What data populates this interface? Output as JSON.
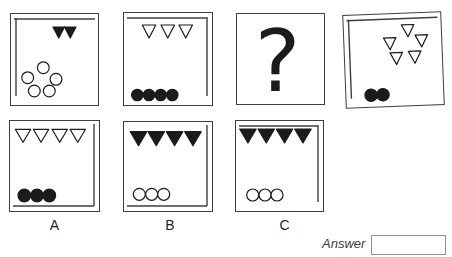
{
  "figure": {
    "cells": [
      {
        "name": "cell-1",
        "inner_line": "top-left",
        "triangles": {
          "style": "filled",
          "count": 2,
          "size": [
            11.5,
            11
          ],
          "positions": [
            [
              42,
              13
            ],
            [
              53.5,
              13
            ]
          ]
        },
        "circles": {
          "style": "outline",
          "count": 5,
          "radius": 5.9,
          "positions": [
            [
              32.3,
              53.7
            ],
            [
              16.7,
              63.7
            ],
            [
              45,
              65.3
            ],
            [
              23.3,
              77
            ],
            [
              38.3,
              77
            ]
          ]
        }
      },
      {
        "name": "cell-2",
        "inner_line": "top-right",
        "triangles": {
          "style": "outline",
          "count": 3,
          "size": [
            13.5,
            13
          ],
          "positions": [
            [
              18.3,
              12
            ],
            [
              37,
              12
            ],
            [
              55,
              12
            ]
          ]
        },
        "circles": {
          "style": "filled",
          "count": 4,
          "radius": 5.7,
          "positions": [
            [
              13.3,
              82
            ],
            [
              25,
              82
            ],
            [
              36.7,
              82
            ],
            [
              48.3,
              82
            ]
          ]
        }
      },
      {
        "name": "cell-question",
        "inner_line": "none",
        "question_mark": "?"
      },
      {
        "name": "cell-3",
        "inner_line": "top-left",
        "triangles": {
          "style": "outline",
          "count": 5,
          "size": [
            12.5,
            12
          ],
          "positions": [
            [
              57.7,
              11.3
            ],
            [
              39.3,
              23.7
            ],
            [
              71,
              22
            ],
            [
              45.3,
              38.7
            ],
            [
              63.7,
              38
            ]
          ]
        },
        "circles": {
          "style": "filled",
          "count": 2,
          "radius": 6.2,
          "positions": [
            [
              24.8,
              80.3
            ],
            [
              36.7,
              80.3
            ]
          ]
        }
      },
      {
        "name": "option-a",
        "label": "A",
        "inner_line": "right-bottom",
        "triangles": {
          "style": "outline",
          "count": 4,
          "size": [
            15.5,
            13
          ],
          "positions": [
            [
              5.3,
              8.3
            ],
            [
              23.3,
              8.3
            ],
            [
              42,
              8.3
            ],
            [
              60,
              8.3
            ]
          ]
        },
        "circles": {
          "style": "filled",
          "count": 3,
          "radius": 6.3,
          "positions": [
            [
              14.3,
              74.5
            ],
            [
              27,
              74.5
            ],
            [
              39.3,
              74.5
            ]
          ]
        }
      },
      {
        "name": "option-b",
        "label": "B",
        "inner_line": "right-bottom",
        "triangles": {
          "style": "filled",
          "count": 4,
          "size": [
            16.5,
            14
          ],
          "positions": [
            [
              6.3,
              9.7
            ],
            [
              24,
              9.7
            ],
            [
              42.3,
              9.7
            ],
            [
              60.7,
              9.7
            ]
          ]
        },
        "circles": {
          "style": "outline",
          "count": 3,
          "radius": 6,
          "positions": [
            [
              15.3,
              72.3
            ],
            [
              27.7,
              72.3
            ],
            [
              39.7,
              72.3
            ]
          ]
        }
      },
      {
        "name": "option-c",
        "label": "C",
        "inner_line": "top-right",
        "triangles": {
          "style": "filled",
          "count": 4,
          "size": [
            16.5,
            14
          ],
          "positions": [
            [
              3.7,
              8
            ],
            [
              22,
              8
            ],
            [
              40.3,
              8
            ],
            [
              58.7,
              8
            ]
          ]
        },
        "circles": {
          "style": "outline",
          "count": 3,
          "radius": 6,
          "positions": [
            [
              16.7,
              74
            ],
            [
              29,
              74
            ],
            [
              41,
              74
            ]
          ]
        }
      }
    ]
  },
  "answer": {
    "label": "Answer",
    "value": ""
  },
  "colors": {
    "ink": "#1b1b1b",
    "box_line": "#3f3f3f",
    "answer_box_border": "#8f8f8f",
    "label_text": "#1f1f1f",
    "page_edge": "#cfcfcf"
  }
}
